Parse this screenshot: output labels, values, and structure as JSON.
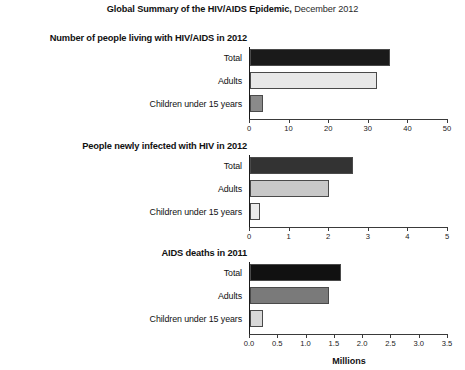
{
  "title": {
    "bold_part": "Global Summary of the HIV/AIDS Epidemic,",
    "regular_part": " December 2012"
  },
  "x_axis_title": "Millions",
  "colors": {
    "total_dark": "#1a1a1a",
    "total_dark2": "#333333",
    "total_dark3": "#111111",
    "adults_light": "#e8e8e8",
    "adults_mid": "#c8c8c8",
    "adults_gray": "#7a7a7a",
    "children_gray": "#8a8a8a",
    "children_pale": "#ebebeb",
    "children_light": "#d8d8d8",
    "axis": "#1a1a1a",
    "text": "#111111"
  },
  "panels": [
    {
      "title": "Number of people living with HIV/AIDS in 2012",
      "categories": [
        "Total",
        "Adults",
        "Children under 15 years"
      ],
      "values": [
        35.3,
        32.0,
        3.3
      ],
      "xlim": [
        0,
        50
      ],
      "ticks": [
        "0",
        "10",
        "20",
        "30",
        "40",
        "50"
      ],
      "tick_values": [
        0,
        10,
        20,
        30,
        40,
        50
      ]
    },
    {
      "title": "People newly infected with HIV in 2012",
      "categories": [
        "Total",
        "Adults",
        "Children under 15 years"
      ],
      "values": [
        2.6,
        2.0,
        0.26
      ],
      "xlim": [
        0,
        5
      ],
      "ticks": [
        "0",
        "1",
        "2",
        "3",
        "4",
        "5"
      ],
      "tick_values": [
        0,
        1,
        2,
        3,
        4,
        5
      ]
    },
    {
      "title": "AIDS deaths in 2011",
      "categories": [
        "Total",
        "Adults",
        "Children under 15 years"
      ],
      "values": [
        1.6,
        1.4,
        0.23
      ],
      "xlim": [
        0,
        3.5
      ],
      "ticks": [
        "0.0",
        "0.5",
        "1.0",
        "1.5",
        "2.0",
        "2.5",
        "3.0",
        "3.5"
      ],
      "tick_values": [
        0,
        0.5,
        1.0,
        1.5,
        2.0,
        2.5,
        3.0,
        3.5
      ]
    }
  ],
  "chart_data": {
    "type": "bar",
    "title": "Global Summary of the HIV/AIDS Epidemic, December 2012",
    "xlabel": "Millions",
    "ylabel": "",
    "orientation": "horizontal",
    "grid": false,
    "legend": "none",
    "panels": [
      {
        "title": "Number of people living with HIV/AIDS in 2012",
        "categories": [
          "Total",
          "Adults",
          "Children under 15 years"
        ],
        "values": [
          35.3,
          32.0,
          3.3
        ],
        "xlim": [
          0,
          50
        ],
        "xticks": [
          0,
          10,
          20,
          30,
          40,
          50
        ],
        "unit": "millions"
      },
      {
        "title": "People newly infected with HIV in 2012",
        "categories": [
          "Total",
          "Adults",
          "Children under 15 years"
        ],
        "values": [
          2.6,
          2.0,
          0.26
        ],
        "xlim": [
          0,
          5
        ],
        "xticks": [
          0,
          1,
          2,
          3,
          4,
          5
        ],
        "unit": "millions"
      },
      {
        "title": "AIDS deaths in 2011",
        "categories": [
          "Total",
          "Adults",
          "Children under 15 years"
        ],
        "values": [
          1.6,
          1.4,
          0.23
        ],
        "xlim": [
          0,
          3.5
        ],
        "xticks": [
          0,
          0.5,
          1.0,
          1.5,
          2.0,
          2.5,
          3.0,
          3.5
        ],
        "unit": "millions"
      }
    ]
  }
}
